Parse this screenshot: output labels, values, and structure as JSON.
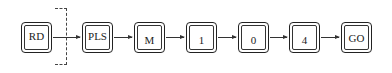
{
  "diagram": {
    "keys": [
      {
        "label": "RD"
      },
      {
        "label": "PLS"
      },
      {
        "label": "M"
      },
      {
        "label": "1"
      },
      {
        "label": "0"
      },
      {
        "label": "4"
      },
      {
        "label": "GO"
      }
    ],
    "connector": "arrow",
    "separator": "dashed-bracket"
  }
}
